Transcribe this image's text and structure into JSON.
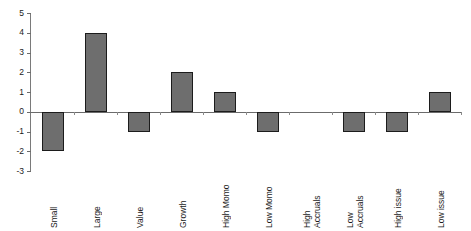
{
  "chart_data": {
    "type": "bar",
    "title": "",
    "subtitle": "",
    "xlabel": "",
    "ylabel": "",
    "grid": false,
    "legend": "none",
    "ylim": [
      -3,
      5
    ],
    "ytick_labels": [
      "5",
      "4",
      "3",
      "2",
      "1",
      "0",
      "-1",
      "-2",
      "-3"
    ],
    "ytick_values": [
      5,
      4,
      3,
      2,
      1,
      0,
      -1,
      -2,
      -3
    ],
    "categories": [
      "Small",
      "Large",
      "Value",
      "Growth",
      "High Momo",
      "Low Momo",
      "High\nAccruals",
      "Low\nAccruals",
      "High issue",
      "Low issue"
    ],
    "values": [
      -2,
      4,
      -1,
      2,
      1,
      -1,
      0,
      -1,
      -1,
      1
    ],
    "series": [
      {
        "name": "",
        "values": [
          -2,
          4,
          -1,
          2,
          1,
          -1,
          0,
          -1,
          -1,
          1
        ]
      }
    ],
    "colors": {
      "bar_fill": "#6e6e6e",
      "bar_border": "#1c1c1c",
      "axis": "#6b6b6b",
      "text": "#1a1a1a",
      "background": "#ffffff"
    }
  }
}
